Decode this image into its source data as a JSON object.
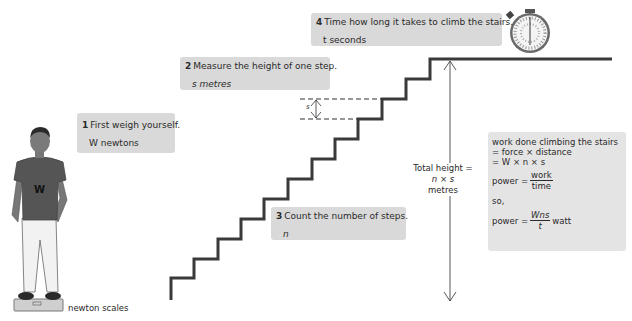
{
  "steps": [
    {
      "number": "1",
      "instruction": "First weigh yourself.",
      "variable": "W newtons"
    },
    {
      "number": "2",
      "instruction": "Measure the height of one step.",
      "variable": "s metres"
    },
    {
      "number": "3",
      "instruction": "Count the number of steps.",
      "variable": "n"
    },
    {
      "number": "4",
      "instruction": "Time how long it takes to climb the stairs.",
      "variable": "t seconds"
    }
  ],
  "step_height_label": "s",
  "total_height": {
    "line1": "Total height =",
    "line2": "n × s",
    "line3": "metres"
  },
  "formula": {
    "line1": "work done climbing the stairs",
    "line2": "= force × distance",
    "line3": "= W × n × s",
    "power_label": "power =",
    "frac1_num": "work",
    "frac1_den": "time",
    "so": "so,",
    "power_label2": "power =",
    "frac2_num": "Wns",
    "frac2_den": "t",
    "unit": "watt"
  },
  "person_shirt_letter": "W",
  "scales_label": "newton scales",
  "icons": [
    "person-figure",
    "newton-scales-icon",
    "stopwatch-icon",
    "staircase",
    "double-arrow-icon"
  ],
  "colors": {
    "box_bg": "#d9d9d9",
    "stair_line": "#333333",
    "formula_bg": "#e4e4e4"
  }
}
